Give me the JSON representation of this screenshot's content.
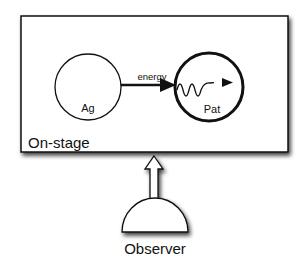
{
  "diagram": {
    "stage": {
      "label": "On-stage"
    },
    "nodes": [
      {
        "id": "agent",
        "label": "Ag"
      },
      {
        "id": "patient",
        "label": "Pat"
      }
    ],
    "edge": {
      "from": "agent",
      "to": "patient",
      "label": "energy"
    },
    "observer": {
      "label": "Observer"
    },
    "colors": {
      "stroke": "#111111",
      "fill": "#ffffff",
      "shadow": "#555555"
    }
  }
}
